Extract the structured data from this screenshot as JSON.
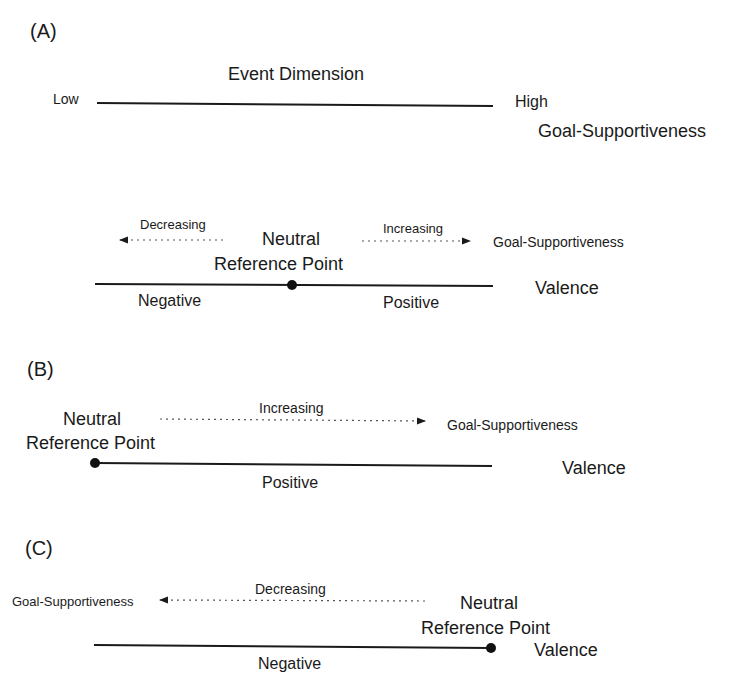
{
  "panel_a": {
    "label": "(A)",
    "event_dimension": {
      "title": "Event Dimension",
      "low": "Low",
      "high": "High",
      "axis_name": "Goal-Supportiveness"
    },
    "valence": {
      "decreasing": "Decreasing",
      "increasing": "Increasing",
      "arrow_target": "Goal-Supportiveness",
      "neutral_line1": "Neutral",
      "neutral_line2": "Reference Point",
      "negative": "Negative",
      "positive": "Positive",
      "axis_name": "Valence"
    }
  },
  "panel_b": {
    "label": "(B)",
    "neutral_line1": "Neutral",
    "neutral_line2": "Reference Point",
    "increasing": "Increasing",
    "arrow_target": "Goal-Supportiveness",
    "positive": "Positive",
    "axis_name": "Valence"
  },
  "panel_c": {
    "label": "(C)",
    "decreasing": "Decreasing",
    "arrow_target": "Goal-Supportiveness",
    "neutral_line1": "Neutral",
    "neutral_line2": "Reference Point",
    "negative": "Negative",
    "axis_name": "Valence"
  }
}
